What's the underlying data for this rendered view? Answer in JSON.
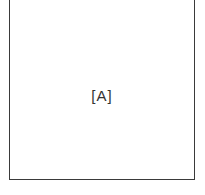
{
  "diagram": {
    "panel": {
      "label": "[A]",
      "border_color": "#3a3a3a",
      "background_color": "#ffffff"
    }
  }
}
